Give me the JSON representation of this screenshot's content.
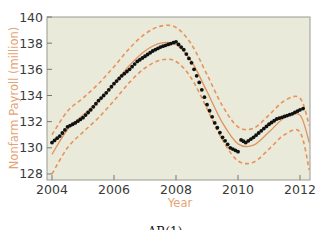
{
  "chart_data": {
    "type": "line",
    "title": "",
    "caption": "AR(1)",
    "xlabel": "Year",
    "ylabel": "Nonfarm Payroll (million)",
    "xlim": [
      2004,
      2012.3
    ],
    "ylim": [
      128,
      140
    ],
    "xticks": [
      2004,
      2006,
      2008,
      2010,
      2012
    ],
    "yticks": [
      128,
      130,
      132,
      134,
      136,
      138,
      140
    ],
    "grid": false,
    "legend": null,
    "colors": {
      "plot_background": "#e9ead9",
      "data_points": "#111111",
      "fit_line": "#e0925e",
      "bands": "#e8925a",
      "axis_title": "#e5a476"
    },
    "series": [
      {
        "name": "Observed nonfarm payroll",
        "style": "scatter",
        "x": [
          2004.0,
          2004.25,
          2004.5,
          2004.75,
          2005.0,
          2005.25,
          2005.5,
          2005.75,
          2006.0,
          2006.25,
          2006.5,
          2006.75,
          2007.0,
          2007.25,
          2007.5,
          2007.75,
          2008.0,
          2008.25,
          2008.5,
          2008.75,
          2009.0,
          2009.25,
          2009.5,
          2009.75,
          2010.0,
          2010.1,
          2010.25,
          2010.5,
          2010.75,
          2011.0,
          2011.25,
          2011.5,
          2011.75,
          2012.0,
          2012.1
        ],
        "values": [
          130.4,
          130.9,
          131.6,
          131.9,
          132.3,
          132.9,
          133.6,
          134.2,
          134.9,
          135.5,
          136.0,
          136.6,
          137.0,
          137.4,
          137.7,
          137.9,
          138.1,
          137.5,
          136.5,
          135.0,
          133.3,
          131.9,
          130.8,
          130.0,
          129.7,
          130.6,
          130.4,
          130.8,
          131.3,
          131.8,
          132.2,
          132.4,
          132.6,
          132.9,
          133.0
        ]
      },
      {
        "name": "AR(1) fitted",
        "style": "solid",
        "x": [
          2004.0,
          2004.5,
          2005.0,
          2005.5,
          2006.0,
          2006.5,
          2007.0,
          2007.5,
          2008.0,
          2008.5,
          2009.0,
          2009.5,
          2010.0,
          2010.5,
          2011.0,
          2011.5,
          2012.0,
          2012.3
        ],
        "values": [
          129.5,
          131.4,
          132.5,
          133.6,
          134.9,
          136.3,
          137.4,
          138.0,
          137.9,
          136.6,
          134.3,
          131.9,
          130.3,
          130.2,
          131.2,
          132.3,
          132.5,
          130.4
        ]
      },
      {
        "name": "Upper band",
        "style": "dashed",
        "x": [
          2004.0,
          2004.5,
          2005.0,
          2005.5,
          2006.0,
          2006.5,
          2007.0,
          2007.5,
          2008.0,
          2008.5,
          2009.0,
          2009.5,
          2010.0,
          2010.5,
          2011.0,
          2011.5,
          2012.0,
          2012.3
        ],
        "values": [
          131.0,
          132.8,
          133.8,
          134.9,
          136.2,
          137.6,
          138.7,
          139.3,
          139.2,
          137.9,
          135.6,
          133.2,
          131.6,
          131.5,
          132.5,
          133.6,
          133.8,
          131.7
        ]
      },
      {
        "name": "Lower band",
        "style": "dashed",
        "x": [
          2004.0,
          2004.5,
          2005.0,
          2005.5,
          2006.0,
          2006.5,
          2007.0,
          2007.5,
          2008.0,
          2008.5,
          2009.0,
          2009.5,
          2010.0,
          2010.5,
          2011.0,
          2011.5,
          2012.0,
          2012.3
        ],
        "values": [
          128.0,
          130.0,
          131.2,
          132.3,
          133.6,
          135.0,
          136.1,
          136.7,
          136.6,
          135.3,
          133.0,
          130.6,
          129.0,
          128.9,
          129.9,
          131.0,
          131.2,
          128.3
        ]
      }
    ]
  }
}
